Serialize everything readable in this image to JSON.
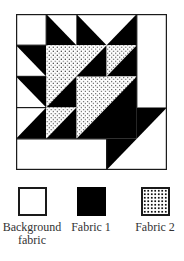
{
  "diagram": {
    "type": "quilt-block",
    "grid": "5x5",
    "colors": {
      "background": "#ffffff",
      "fabric1": "#000000",
      "fabric2_base": "#ffffff",
      "fabric2_dots": "#111111",
      "outline": "#1a1a1a"
    }
  },
  "legend": {
    "items": [
      {
        "key": "background",
        "label_line1": "Background",
        "label_line2": "fabric"
      },
      {
        "key": "fabric1",
        "label_line1": "Fabric 1",
        "label_line2": ""
      },
      {
        "key": "fabric2",
        "label_line1": "Fabric 2",
        "label_line2": ""
      }
    ]
  }
}
